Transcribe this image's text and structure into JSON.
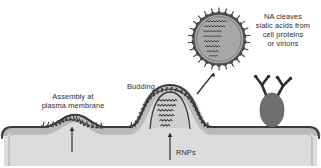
{
  "figure": {
    "background_color": "#ffffff"
  },
  "labels": {
    "assembly": "Assembly at\nplasma membrane",
    "budding": "Budding",
    "rnps": "RNPs",
    "na_note": "NA cleaves\nsialic acids from\ncell proteins\nor virions"
  },
  "structures": {
    "plasma_membrane": {
      "name": "plasma-membrane",
      "outer_line_color": "#3a3a3a",
      "inner_fill_color": "#b9b9b9",
      "cytoplasm_color": "#dcdcdc"
    },
    "virion": {
      "name": "released-virion",
      "envelope_fill": "#a8a8a8",
      "envelope_stroke": "#4a4a4a",
      "spike_color": "#3c3c3c",
      "spike_count": 26,
      "rnp_segments": 8,
      "center_x": 219,
      "center_y": 39,
      "radius": 27
    },
    "budding_particle": {
      "name": "budding-virion",
      "rnp_segments": 9,
      "spike_color": "#3c3c3c"
    },
    "assembly_patch": {
      "name": "assembly-patch",
      "spike_color": "#3c3c3c"
    },
    "sialylated_glycoprotein": {
      "name": "sialylated-glycoprotein",
      "body_fill": "#6f6f6f",
      "branch_color": "#2f2f2f"
    }
  },
  "annotations": {
    "release_arrow": {
      "name": "release-arrow",
      "from": "budding virion",
      "to": "released virion",
      "color": "#2f2f2f"
    },
    "rnps_arrow": {
      "name": "rnps-arrow",
      "direction": "up",
      "color": "#2f2f2f"
    },
    "assembly_arrow": {
      "name": "assembly-arrow",
      "direction": "up",
      "color": "#2f2f2f"
    }
  },
  "colors": {
    "text": "#2b2b2b",
    "dark_line": "#3a3a3a",
    "membrane_inner": "#b9b9b9",
    "cytoplasm": "#dcdcdc",
    "virion_fill": "#a8a8a8",
    "glycoprotein_fill": "#6f6f6f"
  }
}
